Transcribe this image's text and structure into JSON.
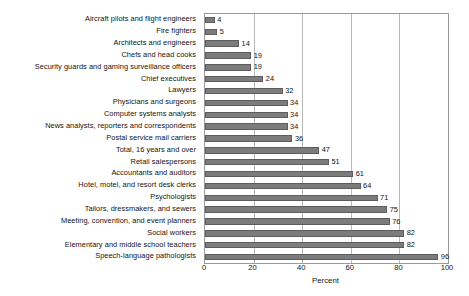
{
  "chart_data": {
    "type": "bar",
    "orientation": "horizontal",
    "title": "",
    "xlabel": "Percent",
    "ylabel": "",
    "xlim": [
      0,
      100
    ],
    "xticks": [
      0,
      20,
      40,
      60,
      80,
      100
    ],
    "grid": true,
    "legend": false,
    "show_data_labels": true,
    "bar_color": "#7c7c7c",
    "bar_edge_color": "#5d5d5d",
    "grid_color": "#b9b9b9",
    "frame_color": "#9a9a9a",
    "categories": [
      "Aircraft pilots and flight engineers",
      "Fire fighters",
      "Architects and engineers",
      "Chefs and head cooks",
      "Security guards and gaming surveillance officers",
      "Chief executives",
      "Lawyers",
      "Physicians and surgeons",
      "Computer systems analysts",
      "News analysts, reporters and correspondents",
      "Postal service mail carriers",
      "Total, 16 years and over",
      "Retail salespersons",
      "Accountants and auditors",
      "Hotel, motel, and resort desk clerks",
      "Psychologists",
      "Tailors, dressmakers, and sewers",
      "Meeting, convention, and event planners",
      "Social workers",
      "Elementary and middle school teachers",
      "Speech-language pathologists"
    ],
    "values": [
      4,
      5,
      14,
      19,
      19,
      24,
      32,
      34,
      34,
      34,
      36,
      47,
      51,
      61,
      64,
      71,
      75,
      76,
      82,
      82,
      96
    ],
    "value_labels": [
      "4",
      "5",
      "14",
      "19",
      "19",
      "24",
      "32",
      "34",
      "34",
      "34",
      "36",
      "47",
      "51",
      "61",
      "64",
      "71",
      "75",
      "76",
      "82",
      "82",
      "96"
    ],
    "xtick_labels": [
      "0",
      "20",
      "40",
      "60",
      "80",
      "100"
    ]
  }
}
